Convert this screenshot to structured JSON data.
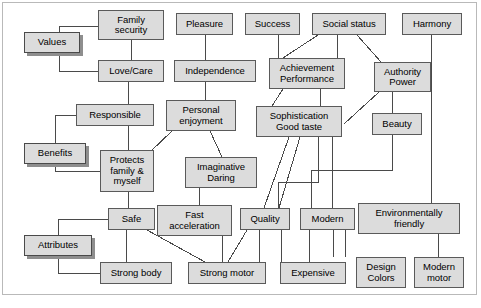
{
  "diagram": {
    "colors": {
      "node_fill": "#dcdcdc",
      "node_border": "#5a5a5a",
      "ladder_border": "#4a4a4a",
      "shadow": "#8e8e8e",
      "frame": "#b9b9b9",
      "link": "#4a4a4a",
      "background": "#ffffff"
    },
    "levels": [
      {
        "id": "values",
        "label": "Values"
      },
      {
        "id": "benefits",
        "label": "Benefits"
      },
      {
        "id": "attributes",
        "label": "Attributes"
      }
    ],
    "nodes": [
      {
        "id": "family_security",
        "label": "Family\nsecurity",
        "line1": "Family",
        "line2": "security",
        "x": 98,
        "y": 10,
        "w": 66,
        "h": 30
      },
      {
        "id": "pleasure",
        "label": "Pleasure",
        "line1": "Pleasure",
        "line2": "",
        "x": 176,
        "y": 13,
        "w": 57,
        "h": 22
      },
      {
        "id": "success",
        "label": "Success",
        "line1": "Success",
        "line2": "",
        "x": 245,
        "y": 13,
        "w": 55,
        "h": 22
      },
      {
        "id": "social_status",
        "label": "Social status",
        "line1": "Social status",
        "line2": "",
        "x": 312,
        "y": 13,
        "w": 74,
        "h": 22
      },
      {
        "id": "harmony",
        "label": "Harmony",
        "line1": "Harmony",
        "line2": "",
        "x": 402,
        "y": 13,
        "w": 60,
        "h": 22
      },
      {
        "id": "love_care",
        "label": "Love/Care",
        "line1": "Love/Care",
        "line2": "",
        "x": 98,
        "y": 60,
        "w": 66,
        "h": 22
      },
      {
        "id": "independence",
        "label": "Independence",
        "line1": "Independence",
        "line2": "",
        "x": 174,
        "y": 60,
        "w": 82,
        "h": 22
      },
      {
        "id": "achievement",
        "label": "Achievement\nPerformance",
        "line1": "Achievement",
        "line2": "Performance",
        "x": 269,
        "y": 58,
        "w": 76,
        "h": 31
      },
      {
        "id": "authority_power",
        "label": "Authority\nPower",
        "line1": "Authority",
        "line2": "Power",
        "x": 374,
        "y": 62,
        "w": 57,
        "h": 30
      },
      {
        "id": "responsible",
        "label": "Responsible",
        "line1": "Responsible",
        "line2": "",
        "x": 76,
        "y": 104,
        "w": 78,
        "h": 22
      },
      {
        "id": "personal_enj",
        "label": "Personal\nenjoyment",
        "line1": "Personal",
        "line2": "enjoyment",
        "x": 166,
        "y": 100,
        "w": 70,
        "h": 31
      },
      {
        "id": "sophistication",
        "label": "Sophistication\nGood taste",
        "line1": "Sophistication",
        "line2": "Good taste",
        "x": 256,
        "y": 106,
        "w": 86,
        "h": 31
      },
      {
        "id": "beauty",
        "label": "Beauty",
        "line1": "Beauty",
        "line2": "",
        "x": 372,
        "y": 113,
        "w": 50,
        "h": 22
      },
      {
        "id": "protects",
        "label": "Protects\nfamily &\nmyself",
        "line1": "Protects",
        "line2": "family &",
        "line3": "myself",
        "x": 100,
        "y": 150,
        "w": 54,
        "h": 42
      },
      {
        "id": "imaginative",
        "label": "Imaginative\nDaring",
        "line1": "Imaginative",
        "line2": "Daring",
        "x": 185,
        "y": 157,
        "w": 72,
        "h": 31
      },
      {
        "id": "safe",
        "label": "Safe",
        "line1": "Safe",
        "line2": "",
        "x": 108,
        "y": 208,
        "w": 47,
        "h": 22
      },
      {
        "id": "fast_accel",
        "label": "Fast\nacceleration",
        "line1": "Fast",
        "line2": "acceleration",
        "x": 157,
        "y": 205,
        "w": 75,
        "h": 31
      },
      {
        "id": "quality",
        "label": "Quality",
        "line1": "Quality",
        "line2": "",
        "x": 240,
        "y": 208,
        "w": 50,
        "h": 22
      },
      {
        "id": "modern",
        "label": "Modern",
        "line1": "Modern",
        "line2": "",
        "x": 300,
        "y": 208,
        "w": 55,
        "h": 22
      },
      {
        "id": "env_friendly",
        "label": "Environmentally\nfriendly",
        "line1": "Environmentally",
        "line2": "friendly",
        "x": 358,
        "y": 203,
        "w": 102,
        "h": 31
      },
      {
        "id": "strong_body",
        "label": "Strong body",
        "line1": "Strong body",
        "line2": "",
        "x": 100,
        "y": 262,
        "w": 72,
        "h": 22
      },
      {
        "id": "strong_motor",
        "label": "Strong motor",
        "line1": "Strong motor",
        "line2": "",
        "x": 188,
        "y": 262,
        "w": 78,
        "h": 22
      },
      {
        "id": "expensive",
        "label": "Expensive",
        "line1": "Expensive",
        "line2": "",
        "x": 280,
        "y": 262,
        "w": 66,
        "h": 22
      },
      {
        "id": "design_colors",
        "label": "Design\nColors",
        "line1": "Design",
        "line2": "Colors",
        "x": 356,
        "y": 257,
        "w": 50,
        "h": 31
      },
      {
        "id": "modern_motor",
        "label": "Modern\nmotor",
        "line1": "Modern",
        "line2": "motor",
        "x": 414,
        "y": 257,
        "w": 50,
        "h": 31
      }
    ],
    "ladder_labels": [
      {
        "id": "values_label",
        "label": "Values",
        "x": 24,
        "y": 32,
        "w": 56,
        "h": 21
      },
      {
        "id": "benefits_label",
        "label": "Benefits",
        "x": 24,
        "y": 143,
        "w": 62,
        "h": 21
      },
      {
        "id": "attributes_label",
        "label": "Attributes",
        "x": 24,
        "y": 235,
        "w": 68,
        "h": 21
      }
    ],
    "links": [
      {
        "from": "family_security",
        "to": "love_care",
        "type": "vertical"
      },
      {
        "from": "love_care",
        "to": "responsible",
        "type": "vertical"
      },
      {
        "from": "responsible",
        "to": "protects",
        "type": "vertical"
      },
      {
        "from": "protects",
        "to": "safe",
        "type": "vertical"
      },
      {
        "from": "safe",
        "to": "strong_body",
        "type": "vertical"
      },
      {
        "from": "safe",
        "to": "strong_motor",
        "type": "diagonal"
      },
      {
        "from": "pleasure",
        "to": "independence",
        "type": "vertical"
      },
      {
        "from": "independence",
        "to": "personal_enj",
        "type": "vertical"
      },
      {
        "from": "personal_enj",
        "to": "protects",
        "type": "diagonal"
      },
      {
        "from": "personal_enj",
        "to": "imaginative",
        "type": "diagonal"
      },
      {
        "from": "imaginative",
        "to": "fast_accel",
        "type": "vertical"
      },
      {
        "from": "fast_accel",
        "to": "strong_motor",
        "type": "vertical"
      },
      {
        "from": "success",
        "to": "achievement",
        "type": "vertical"
      },
      {
        "from": "social_status",
        "to": "achievement",
        "type": "diagonal"
      },
      {
        "from": "social_status",
        "to": "achievement",
        "type": "vertical"
      },
      {
        "from": "social_status",
        "to": "authority_power",
        "type": "diagonal"
      },
      {
        "from": "achievement",
        "to": "sophistication",
        "type": "diagonal"
      },
      {
        "from": "achievement",
        "to": "sophistication",
        "type": "vertical"
      },
      {
        "from": "authority_power",
        "to": "sophistication",
        "type": "diagonal"
      },
      {
        "from": "authority_power",
        "to": "beauty",
        "type": "vertical"
      },
      {
        "from": "beauty",
        "to": "modern",
        "type": "elbow"
      },
      {
        "from": "sophistication",
        "to": "quality",
        "type": "diagonal"
      },
      {
        "from": "sophistication",
        "to": "modern",
        "type": "diagonal"
      },
      {
        "from": "sophistication",
        "to": "modern",
        "type": "vertical"
      },
      {
        "from": "quality",
        "to": "strong_motor",
        "type": "diagonal"
      },
      {
        "from": "quality",
        "to": "expensive",
        "type": "vertical"
      },
      {
        "from": "modern",
        "to": "expensive",
        "type": "vertical"
      },
      {
        "from": "modern",
        "to": "design_colors",
        "type": "vertical"
      },
      {
        "from": "harmony",
        "to": "env_friendly",
        "type": "vertical"
      },
      {
        "from": "env_friendly",
        "to": "modern_motor",
        "type": "vertical"
      }
    ]
  }
}
